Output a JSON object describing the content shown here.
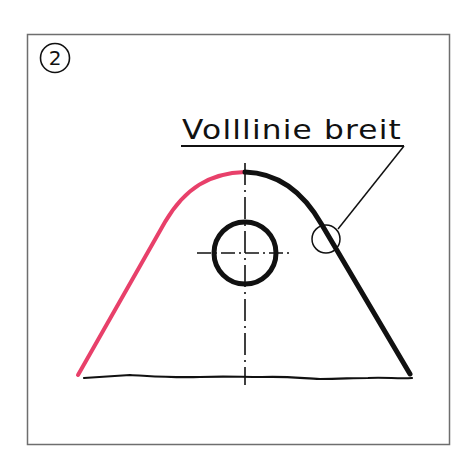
{
  "figure": {
    "badge_number": "2",
    "label": "Volllinie breit",
    "colors": {
      "frame": "#6e6e6e",
      "ink": "#111111",
      "highlight": "#e8406a",
      "background": "#ffffff"
    },
    "elements": [
      {
        "name": "frame",
        "type": "rectangle"
      },
      {
        "name": "badge",
        "type": "circled-number"
      },
      {
        "name": "label",
        "type": "text-with-underline"
      },
      {
        "name": "leader-line",
        "type": "line"
      },
      {
        "name": "detail-marker",
        "type": "small-circle"
      },
      {
        "name": "contour-left",
        "type": "thin-curve",
        "color": "highlight"
      },
      {
        "name": "contour-right",
        "type": "wide-solid-line"
      },
      {
        "name": "base-line",
        "type": "freehand-break-line"
      },
      {
        "name": "hole",
        "type": "circle"
      },
      {
        "name": "center-lines",
        "type": "dash-dot"
      }
    ]
  }
}
